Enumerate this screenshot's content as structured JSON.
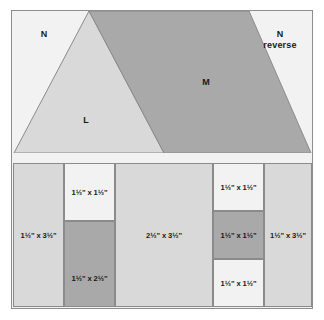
{
  "diagram": {
    "colors": {
      "background": "#f2f2f2",
      "light_gray": "#d9d9d9",
      "dark_gray": "#a9a9a9",
      "outline": "#8b8b8b",
      "text": "#1a1a1a"
    }
  },
  "upper_unit": {
    "pieces": [
      {
        "id": "n-left",
        "label": "N",
        "shade": "background"
      },
      {
        "id": "l-triangle",
        "label": "L",
        "shade": "light"
      },
      {
        "id": "m-parallelogram",
        "label": "M",
        "shade": "dark"
      },
      {
        "id": "n-right",
        "label": "N\nreverse",
        "shade": "background"
      }
    ],
    "labels": {
      "n_left": "N",
      "l": "L",
      "m": "M",
      "n_right_line1": "N",
      "n_right_line2": "reverse"
    }
  },
  "cut_chart": {
    "columns": [
      {
        "id": "col-1",
        "cells": [
          {
            "id": "c1-r1",
            "shade": "light",
            "width_in": "1½\"",
            "height_in": "3½\"",
            "label": "1½\" x 3½\""
          }
        ]
      },
      {
        "id": "col-2",
        "cells": [
          {
            "id": "c2-r1",
            "shade": "background",
            "width_in": "1½\"",
            "height_in": "1½\"",
            "label": "1½\" x 1½\""
          },
          {
            "id": "c2-r2",
            "shade": "dark",
            "width_in": "1½\"",
            "height_in": "2½\"",
            "label": "1½\" x 2½\""
          }
        ]
      },
      {
        "id": "col-3",
        "cells": [
          {
            "id": "c3-r1",
            "shade": "light",
            "width_in": "2½\"",
            "height_in": "3½\"",
            "label": "2½\" x 3½\""
          }
        ]
      },
      {
        "id": "col-4",
        "cells": [
          {
            "id": "c4-r1",
            "shade": "background",
            "width_in": "1½\"",
            "height_in": "1½\"",
            "label": "1½\" x 1½\""
          },
          {
            "id": "c4-r2",
            "shade": "dark",
            "width_in": "1½\"",
            "height_in": "1½\"",
            "label": "1½\" x 1½\""
          },
          {
            "id": "c4-r3",
            "shade": "background",
            "width_in": "1½\"",
            "height_in": "1½\"",
            "label": "1½\" x 1½\""
          }
        ]
      },
      {
        "id": "col-5",
        "cells": [
          {
            "id": "c5-r1",
            "shade": "light",
            "width_in": "1½\"",
            "height_in": "3½\"",
            "label": "1½\" x 3½\""
          }
        ]
      }
    ]
  }
}
